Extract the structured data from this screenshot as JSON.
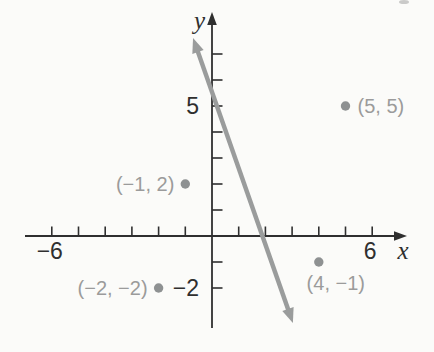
{
  "figure": {
    "background": "#fbfbf9",
    "axis_color": "#2f2f2f",
    "line_color": "#9a9c9c",
    "point_color": "#8e9192",
    "point_label_color": "#9b9b9b",
    "tick_label_color": "#2f2f2f"
  },
  "chart_data": {
    "type": "scatter",
    "title": "",
    "xlabel": "x",
    "ylabel": "y",
    "xlim": [
      -7,
      7.3
    ],
    "ylim": [
      -3.5,
      8.6
    ],
    "grid": false,
    "legend": false,
    "x_ticks": [
      -6,
      -5,
      -4,
      -3,
      -2,
      -1,
      1,
      2,
      3,
      4,
      5,
      6
    ],
    "y_ticks": [
      1,
      2,
      3,
      4,
      5,
      6,
      7,
      -1,
      -2
    ],
    "x_tick_labels": [
      {
        "value": -6,
        "text": "−6"
      },
      {
        "value": 6,
        "text": "6"
      }
    ],
    "y_tick_labels": [
      {
        "value": 5,
        "text": "5"
      },
      {
        "value": -2,
        "text": "−2"
      }
    ],
    "points": [
      {
        "x": 5,
        "y": 5,
        "label": "(5, 5)",
        "label_side": "right"
      },
      {
        "x": -1,
        "y": 2,
        "label": "(−1, 2)",
        "label_side": "left"
      },
      {
        "x": -2,
        "y": -2,
        "label": "(−2, −2)",
        "label_side": "left"
      },
      {
        "x": 4,
        "y": -1,
        "label": "(4, −1)",
        "label_side": "below"
      }
    ],
    "line": {
      "style": "straight",
      "endpoints": [
        {
          "x": -0.71,
          "y": 7.62
        },
        {
          "x": 3.03,
          "y": -3.35
        }
      ],
      "arrows_both_ends": true
    }
  }
}
